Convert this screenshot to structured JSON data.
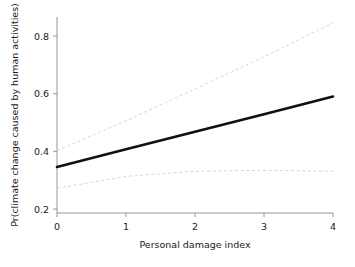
{
  "chart_data": {
    "type": "line",
    "title": "",
    "subtitle": "",
    "xlabel": "Personal damage index",
    "ylabel": "Pr(climate change caused by human activities)",
    "xlim": [
      0,
      4
    ],
    "ylim": [
      0.17,
      0.87
    ],
    "xticks": [
      0,
      1,
      2,
      3,
      4
    ],
    "xticklabels": [
      "0",
      "1",
      "2",
      "3",
      "4"
    ],
    "yticks": [
      0.2,
      0.4,
      0.6,
      0.8
    ],
    "yticklabels": [
      "0.2",
      "0.4",
      "0.6",
      "0.8"
    ],
    "grid": false,
    "legend": null,
    "annotations": [],
    "series": [
      {
        "name": "Predicted probability",
        "style": "solid",
        "color": "#111111",
        "x": [
          0,
          1,
          2,
          3,
          4
        ],
        "values": [
          0.346,
          0.407,
          0.468,
          0.529,
          0.59
        ]
      },
      {
        "name": "Upper 95% confidence limit",
        "style": "dashed",
        "color": "#d8d8dc",
        "x": [
          0,
          1,
          2,
          3,
          4
        ],
        "values": [
          0.402,
          0.506,
          0.616,
          0.728,
          0.845
        ]
      },
      {
        "name": "Lower 95% confidence limit",
        "style": "dashed",
        "color": "#d8d8dc",
        "x": [
          0,
          1,
          2,
          3,
          4
        ],
        "values": [
          0.272,
          0.313,
          0.331,
          0.334,
          0.331
        ]
      }
    ]
  },
  "axes": {
    "x_axis_name": "x-axis",
    "y_axis_name": "y-axis"
  }
}
